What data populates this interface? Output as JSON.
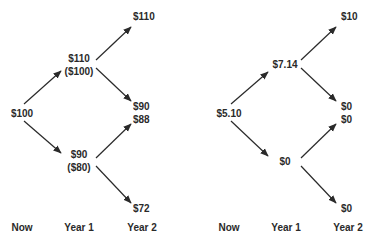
{
  "diagrams": [
    {
      "id": "stock-tree",
      "nodes": {
        "now": "$100",
        "y1_up": "$110",
        "y1_up_sub": "($100)",
        "y1_down": "$90",
        "y1_down_sub": "($80)",
        "y2_uu": "$110",
        "y2_ud": "$90",
        "y2_du": "$88",
        "y2_dd": "$72"
      },
      "axis": [
        "Now",
        "Year 1",
        "Year 2"
      ]
    },
    {
      "id": "option-tree",
      "nodes": {
        "now": "$5.10",
        "y1_up": "$7.14",
        "y1_down": "$0",
        "y2_uu": "$10",
        "y2_ud": "$0",
        "y2_du": "$0",
        "y2_dd": "$0"
      },
      "axis": [
        "Now",
        "Year 1",
        "Year 2"
      ]
    }
  ],
  "colors": {
    "ink": "#2a2a2a",
    "background": "#ffffff"
  }
}
